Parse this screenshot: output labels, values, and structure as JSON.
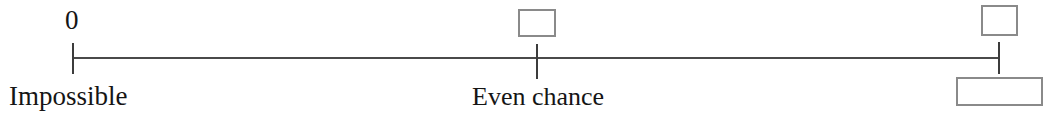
{
  "worksheet": {
    "type": "probability-number-line",
    "axis": {
      "line_color": "#4a4a4a",
      "tick_color": "#3c3c3c",
      "min_value": "0",
      "start_label": "Impossible",
      "middle_label": "Even chance"
    },
    "ticks": [
      {
        "name": "impossible",
        "value_label": "0",
        "position_pct": 0
      },
      {
        "name": "even-chance",
        "value_label": "",
        "position_pct": 50
      },
      {
        "name": "certain",
        "value_label": "",
        "position_pct": 100
      }
    ],
    "answer_boxes": [
      {
        "name": "middle-value-box",
        "value": "",
        "border_color": "#8a8a8a"
      },
      {
        "name": "right-value-box",
        "value": "",
        "border_color": "#8a8a8a"
      },
      {
        "name": "right-description-box",
        "value": "",
        "border_color": "#8a8a8a"
      }
    ]
  }
}
